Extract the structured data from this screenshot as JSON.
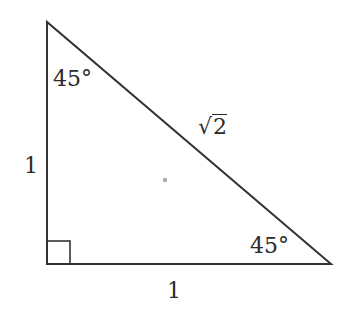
{
  "diagram": {
    "type": "right-isosceles-triangle",
    "stroke_color": "#333333",
    "dot_color": "#aaaaaa",
    "vertices": {
      "top": [
        47,
        22
      ],
      "right_angle": [
        47,
        264
      ],
      "bottom_right": [
        331,
        264
      ]
    },
    "right_angle_marker": {
      "x": 47,
      "y": 241,
      "size": 23
    },
    "center_dot": [
      165,
      180
    ],
    "labels": {
      "top_angle": "45°",
      "bottom_right_angle": "45°",
      "left_side": "1",
      "bottom_side": "1",
      "hypotenuse_radical": "√",
      "hypotenuse_radicand": "2"
    }
  }
}
